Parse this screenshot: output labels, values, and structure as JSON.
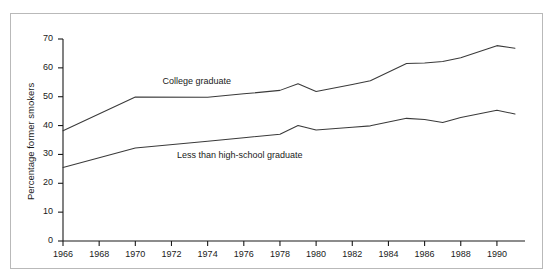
{
  "chart_data": {
    "type": "line",
    "title": "",
    "subtitle": "",
    "xlabel": "",
    "ylabel": "Percentage former smokers",
    "xlim": [
      1966,
      1991
    ],
    "ylim": [
      0,
      70
    ],
    "grid": false,
    "legend_position": "inline-annotation",
    "x_ticks": [
      1966,
      1968,
      1970,
      1972,
      1974,
      1976,
      1978,
      1980,
      1982,
      1984,
      1986,
      1988,
      1990
    ],
    "x_tick_labels": [
      "1966",
      "1968",
      "1970",
      "1972",
      "1974",
      "1976",
      "1978",
      "1980",
      "1982",
      "1984",
      "1986",
      "1988",
      "1990"
    ],
    "y_ticks": [
      0,
      10,
      20,
      30,
      40,
      50,
      60,
      70
    ],
    "y_tick_labels": [
      "0",
      "10",
      "20",
      "30",
      "40",
      "50",
      "60",
      "70"
    ],
    "x": [
      1966,
      1970,
      1974,
      1976,
      1978,
      1979,
      1980,
      1982,
      1983,
      1985,
      1986,
      1987,
      1988,
      1990,
      1991
    ],
    "series": [
      {
        "name": "College graduate",
        "label": "College graduate",
        "color": "#3a3a3a",
        "values": [
          38.2,
          49.9,
          49.8,
          51.0,
          52.2,
          54.5,
          51.8,
          54.2,
          55.5,
          61.5,
          61.7,
          62.2,
          63.5,
          67.7,
          66.8
        ]
      },
      {
        "name": "Less than high-school graduate",
        "label": "Less than high-school graduate",
        "color": "#3a3a3a",
        "values": [
          25.5,
          32.2,
          34.6,
          35.8,
          37.0,
          40.0,
          38.5,
          39.4,
          39.9,
          42.5,
          42.1,
          41.1,
          42.8,
          45.3,
          44.0
        ]
      }
    ],
    "annotations": [
      {
        "text": "College graduate",
        "x": 1971.5,
        "y": 55.2
      },
      {
        "text": "Less than high-school graduate",
        "x": 1972.3,
        "y": 29.5
      }
    ]
  },
  "axis": {
    "y_axis_title": "Percentage former smokers"
  },
  "colors": {
    "line": "#3a3a3a",
    "axis": "#1a1a1a",
    "frame": "#b9b9b9",
    "background": "#ffffff"
  }
}
